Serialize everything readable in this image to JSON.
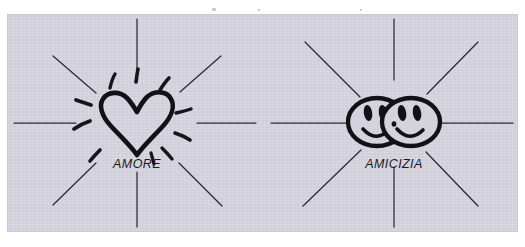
{
  "image": {
    "kind": "scanned-illustration",
    "title": "Amore e Amicizia — hand-drawn symbols",
    "background_color": "#d3d2dd",
    "page_color": "#ffffff",
    "ink_color": "#1a1a1f",
    "border_color": "#c9c8d4"
  },
  "panel": {
    "x": 7,
    "y": 14,
    "width": 511,
    "height": 218
  },
  "symbols": [
    {
      "id": "amore",
      "label": "AMORE",
      "glyph": "heart",
      "center_x": 137,
      "center_y": 123,
      "rays": 8,
      "sparkle_dashes": 8,
      "description": "Hand-drawn heart outline with short curved sparkle dashes and an eight-ray starburst"
    },
    {
      "id": "amicizia",
      "label": "AMICIZIA",
      "glyph": "two-smiley-faces",
      "center_x": 394,
      "center_y": 123,
      "rays": 8,
      "sparkle_dashes": 0,
      "description": "Two overlapping hand-drawn smiley faces with oval eyes and curved smiles, inside an eight-ray starburst"
    }
  ],
  "labels": {
    "amore": "AMORE",
    "amicizia": "AMICIZIA"
  }
}
